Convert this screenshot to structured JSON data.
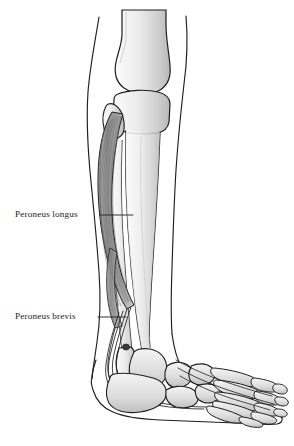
{
  "figure": {
    "type": "anatomical-illustration",
    "view": "lateral view of lower leg and foot",
    "background_color": "#ffffff",
    "line_color": "#1a1a1a",
    "bone_fill_light": "#f2f2f2",
    "bone_fill_mid": "#d8d8d8",
    "bone_fill_dark": "#bdbdbd",
    "muscle_fill": "#9a9a9a",
    "tendon_fill": "#cfcfcf",
    "caption": ""
  },
  "labels": [
    {
      "id": "peroneus-longus",
      "text": "Peroneus longus",
      "leader": {
        "start_x": 100,
        "start_y": 215,
        "end_x": 133,
        "end_y": 215
      }
    },
    {
      "id": "peroneus-brevis",
      "text": "Peroneus brevis",
      "leader": {
        "start_x": 98,
        "start_y": 317,
        "end_x": 126,
        "end_y": 317
      }
    }
  ],
  "structures": {
    "skin_outline": "skin contour of leg and foot",
    "femur": "distal femur with condyle",
    "tibia": "tibia shaft and plateau",
    "fibula": "fibula with head and lateral malleolus",
    "talus": "talus",
    "calcaneus": "calcaneus",
    "navicular": "navicular",
    "cuneiforms": "cuneiform bones",
    "cuboid": "cuboid",
    "metatarsals": "metatarsal bones",
    "phalanges": "phalanges"
  }
}
